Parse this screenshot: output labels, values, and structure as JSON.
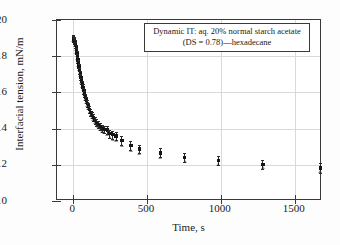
{
  "figure": {
    "background": "#fdfdfd",
    "frame_color": "#3a3a3a",
    "grid_color": "#d9d9d9",
    "marker_color": "#151515",
    "secondary_marker_color": "#8e8e8e"
  },
  "annotation": {
    "line1": "Dynamic IT: aq. 20% normal starch acetate",
    "line2": "(DS = 0.78)—hexadecane"
  },
  "chart_data": {
    "type": "scatter",
    "title": "",
    "subtitle": "",
    "xlabel": "Time, s",
    "ylabel": "Interfacial tension, mN/m",
    "xlim": [
      -110,
      1685
    ],
    "ylim": [
      10,
      20
    ],
    "xticks": [
      0,
      500,
      1000,
      1500
    ],
    "yticks": [
      10,
      12,
      14,
      16,
      18,
      20
    ],
    "xtick_labels": [
      "0",
      "500",
      "1000",
      "1500"
    ],
    "ytick_labels": [
      "10",
      "12",
      "14",
      "16",
      "18",
      "20"
    ],
    "grid": true,
    "legend_position": "upper right",
    "annotations": [
      "Dynamic IT: aq. 20% normal starch acetate",
      "(DS = 0.78)—hexadecane"
    ],
    "series": [
      {
        "name": "Interfacial tension (dark square, mean)",
        "marker": "square",
        "color": "#151515",
        "error_bars": true,
        "x": [
          2,
          5,
          8,
          11,
          14,
          17,
          20,
          23,
          26,
          29,
          32,
          36,
          40,
          44,
          48,
          52,
          57,
          62,
          67,
          72,
          78,
          84,
          90,
          97,
          104,
          112,
          120,
          129,
          138,
          148,
          159,
          171,
          184,
          198,
          213,
          230,
          248,
          268,
          290,
          330,
          390,
          450,
          590,
          755,
          985,
          1285,
          1675
        ],
        "y": [
          19.0,
          18.96,
          18.9,
          18.82,
          18.72,
          18.6,
          18.46,
          18.3,
          18.14,
          17.97,
          17.8,
          17.6,
          17.4,
          17.2,
          17.02,
          16.84,
          16.64,
          16.46,
          16.28,
          16.1,
          15.92,
          15.74,
          15.58,
          15.4,
          15.24,
          15.06,
          14.9,
          14.74,
          14.6,
          14.46,
          14.34,
          14.22,
          14.1,
          14.0,
          13.96,
          13.92,
          13.72,
          13.66,
          13.6,
          13.34,
          13.06,
          12.88,
          12.66,
          12.4,
          12.24,
          12.02,
          11.82
        ],
        "yerr": [
          0.18,
          0.17,
          0.17,
          0.17,
          0.17,
          0.17,
          0.17,
          0.17,
          0.17,
          0.17,
          0.17,
          0.17,
          0.17,
          0.17,
          0.17,
          0.17,
          0.17,
          0.17,
          0.17,
          0.17,
          0.18,
          0.18,
          0.18,
          0.18,
          0.18,
          0.18,
          0.18,
          0.18,
          0.18,
          0.19,
          0.19,
          0.19,
          0.2,
          0.2,
          0.21,
          0.21,
          0.22,
          0.22,
          0.22,
          0.23,
          0.24,
          0.24,
          0.25,
          0.25,
          0.26,
          0.26,
          0.27
        ]
      },
      {
        "name": "Interfacial tension (gray triangle, replicate)",
        "marker": "triangle",
        "color": "#8e8e8e",
        "error_bars": false,
        "x": [
          2,
          5,
          8,
          11,
          14,
          17,
          20,
          23,
          26,
          29,
          32,
          36,
          40,
          44,
          48,
          52,
          57,
          62,
          67,
          72,
          78,
          84,
          90,
          97,
          104,
          112,
          120,
          129,
          138,
          148,
          159,
          171,
          184,
          198,
          213,
          230,
          248,
          268,
          290,
          330,
          390,
          450,
          590,
          755,
          985,
          1285,
          1675
        ],
        "y": [
          18.86,
          18.82,
          18.76,
          18.68,
          18.58,
          18.46,
          18.32,
          18.16,
          18.0,
          17.83,
          17.66,
          17.46,
          17.26,
          17.06,
          16.88,
          16.7,
          16.5,
          16.32,
          16.14,
          15.96,
          15.78,
          15.6,
          15.44,
          15.26,
          15.1,
          14.92,
          14.76,
          14.6,
          14.46,
          14.32,
          14.2,
          14.08,
          13.94,
          13.82,
          13.74,
          13.66,
          13.46,
          13.38,
          13.3,
          13.04,
          12.78,
          12.6,
          12.4,
          12.14,
          12.0,
          11.8,
          11.58
        ]
      }
    ]
  }
}
